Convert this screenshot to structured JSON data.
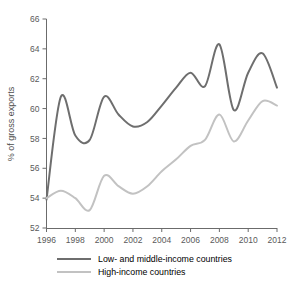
{
  "chart_data": {
    "type": "line",
    "title": "",
    "subtitle": "",
    "xlabel": "",
    "ylabel": "% of gross exports",
    "xlim": [
      1996,
      2012
    ],
    "ylim": [
      52,
      66
    ],
    "x_ticks": [
      1996,
      1998,
      2000,
      2002,
      2004,
      2006,
      2008,
      2010,
      2012
    ],
    "y_ticks": [
      52,
      54,
      56,
      58,
      60,
      62,
      64,
      66
    ],
    "grid": false,
    "legend_position": "bottom",
    "x": [
      1996,
      1997,
      1998,
      1999,
      2000,
      2001,
      2002,
      2003,
      2004,
      2005,
      2006,
      2007,
      2008,
      2009,
      2010,
      2011,
      2012
    ],
    "series": [
      {
        "name": "Low- and middle-income countries",
        "color": "#6e6e6e",
        "values": [
          53.9,
          60.8,
          58.2,
          57.9,
          60.8,
          59.6,
          58.8,
          59.1,
          60.2,
          61.4,
          62.4,
          61.5,
          64.3,
          59.9,
          62.4,
          63.7,
          61.4
        ]
      },
      {
        "name": "High-income countries",
        "color": "#c2c2c2",
        "values": [
          54.0,
          54.5,
          54.0,
          53.2,
          55.5,
          54.8,
          54.3,
          54.8,
          55.8,
          56.6,
          57.5,
          57.9,
          59.6,
          57.8,
          59.2,
          60.5,
          60.2
        ]
      }
    ]
  },
  "axes": {
    "y_label": "% of gross exports",
    "y_tick_labels": [
      "52",
      "54",
      "56",
      "58",
      "60",
      "62",
      "64",
      "66"
    ],
    "x_tick_labels": [
      "1996",
      "1998",
      "2000",
      "2002",
      "2004",
      "2006",
      "2008",
      "2010",
      "2012"
    ]
  },
  "legend": {
    "items": [
      {
        "label": "Low- and middle-income countries",
        "color": "#6e6e6e"
      },
      {
        "label": "High-income countries",
        "color": "#c2c2c2"
      }
    ]
  }
}
